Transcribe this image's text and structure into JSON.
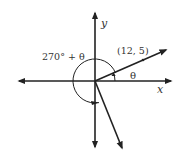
{
  "diagram": {
    "axes": {
      "x_label": "x",
      "y_label": "y"
    },
    "point": {
      "label": "(12, 5)",
      "coords": [
        12,
        5
      ]
    },
    "angles": {
      "theta_label": "θ",
      "big_angle_label": "270° + θ"
    },
    "colors": {
      "stroke": "#222222",
      "text": "#333333"
    }
  }
}
